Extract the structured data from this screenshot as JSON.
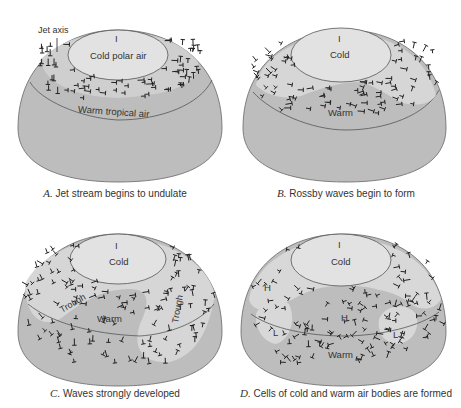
{
  "figure": {
    "colors": {
      "background": "#ffffff",
      "dome": "#bdbdbd",
      "polar_cap": "#e2e2e2",
      "cold_tongue": "#d8d8d8",
      "outline": "#555555",
      "arrows": "#222222",
      "text": "#333333"
    },
    "panels": [
      {
        "id": "A",
        "letter": "A.",
        "caption": "Jet stream begins to undulate",
        "labels": {
          "jet_axis": "Jet axis",
          "pole_marker": "I",
          "cold": "Cold polar air",
          "warm": "Warm tropical air"
        }
      },
      {
        "id": "B",
        "letter": "B.",
        "caption": "Rossby waves begin to form",
        "labels": {
          "pole_marker": "I",
          "cold": "Cold",
          "warm": "Warm"
        }
      },
      {
        "id": "C",
        "letter": "C.",
        "caption": "Waves strongly developed",
        "labels": {
          "pole_marker": "I",
          "cold": "Cold",
          "warm": "Warm",
          "trough_left": "Trough",
          "trough_right": "Trough"
        }
      },
      {
        "id": "D",
        "letter": "D.",
        "caption": "Cells of cold and warm air bodies are formed",
        "labels": {
          "pole_marker": "I",
          "cold": "Cold",
          "warm": "Warm",
          "high_left": "H",
          "high_center": "H",
          "low_left": "L",
          "low_right": "L"
        }
      }
    ]
  }
}
